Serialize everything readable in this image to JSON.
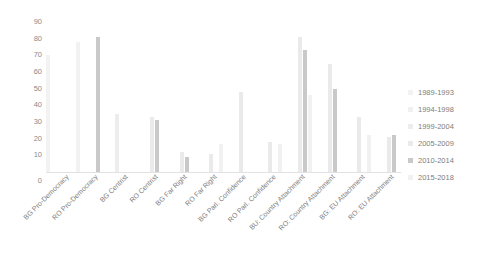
{
  "chart_data": {
    "type": "bar",
    "title": "",
    "xlabel": "",
    "ylabel": "",
    "ylim": [
      0,
      90
    ],
    "yticks": [
      0,
      10,
      20,
      30,
      40,
      50,
      60,
      70,
      80,
      90
    ],
    "grid": false,
    "legend_position": "right",
    "categories": [
      "BG Pro-Democracy",
      "RO Pro-Democracy",
      "BG Centrist",
      "RO Centrist",
      "BG Far Right",
      "RO Far Right",
      "BG Parl. Confidence",
      "RO Parl. Confidence",
      "BU: Country Attachment",
      "RO: Country Attachment",
      "BG: EU Attachment",
      "RO: EU Attachment"
    ],
    "series": [
      {
        "name": "1989-1993",
        "color": "#f2f2f2",
        "values": [
          70,
          78,
          null,
          null,
          null,
          null,
          null,
          null,
          null,
          null,
          null,
          null
        ]
      },
      {
        "name": "1994-1998",
        "color": "#f0f0f0",
        "values": [
          null,
          null,
          null,
          null,
          null,
          null,
          null,
          null,
          null,
          null,
          null,
          null
        ]
      },
      {
        "name": "1999-2004",
        "color": "#ededed",
        "values": [
          null,
          null,
          35,
          null,
          null,
          null,
          null,
          null,
          null,
          null,
          null,
          null
        ]
      },
      {
        "name": "2005-2009",
        "color": "#eaeaea",
        "values": [
          null,
          null,
          null,
          33,
          12,
          11,
          48,
          18,
          81,
          65,
          33,
          21
        ]
      },
      {
        "name": "2010-2014",
        "color": "#c9c9c9",
        "values": [
          null,
          81,
          null,
          31,
          9,
          null,
          null,
          null,
          73,
          50,
          null,
          22
        ]
      },
      {
        "name": "2015-2018",
        "color": "#f1f1f1",
        "values": [
          null,
          null,
          null,
          null,
          null,
          17,
          null,
          17,
          46,
          null,
          22,
          null
        ]
      }
    ]
  },
  "legend": {
    "items": [
      {
        "label": "1989-1993"
      },
      {
        "label": "1994-1998"
      },
      {
        "label": "1999-2004"
      },
      {
        "label": "2005-2009"
      },
      {
        "label": "2010-2014"
      },
      {
        "label": "2015-2018"
      }
    ]
  }
}
